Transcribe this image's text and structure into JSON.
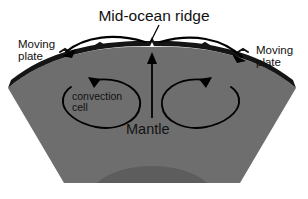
{
  "diagram": {
    "title": "Mid-ocean ridge",
    "labels": {
      "title": "Mid-ocean ridge",
      "moving_plate_left_line1": "Moving",
      "moving_plate_left_line2": "plate",
      "moving_plate_right_line1": "Moving",
      "moving_plate_right_line2": "plate",
      "convection_line1": "convection",
      "convection_line2": "cell",
      "mantle": "Mantle"
    },
    "icons": {
      "leader_line": "leader-line",
      "left_plate_arrow": "left-arrow",
      "right_plate_arrow": "right-arrow",
      "upwelling_arrow": "up-arrow",
      "left_convection_arrow": "counterclockwise-loop-arrow",
      "right_convection_arrow": "clockwise-loop-arrow"
    },
    "colors": {
      "background": "#ffffff",
      "crust": "#1a1a1a",
      "mantle": "#6e6e6e",
      "deep_mantle": "#5e5e5e",
      "ink": "#111111"
    },
    "geometry": {
      "width": 308,
      "height": 199,
      "ridge_peak_x": 152,
      "ridge_peak_y": 47,
      "crust_thickness": 8
    }
  }
}
